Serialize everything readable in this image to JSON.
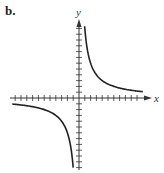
{
  "panel_label": "b.",
  "chart_data": {
    "type": "line",
    "title": "",
    "xlabel": "x",
    "ylabel": "y",
    "function": "y = k/x (rectangular hyperbola, k ≈ 12)",
    "xlim": [
      -11,
      11
    ],
    "ylim": [
      -12,
      13
    ],
    "grid": false,
    "tick_spacing": 1,
    "tick_labels": false,
    "series": [
      {
        "name": "branch-quadrant-I",
        "x": [
          1,
          1.5,
          2,
          3,
          4,
          6,
          8,
          10
        ],
        "y": [
          12,
          8,
          6,
          4,
          3,
          2,
          1.5,
          1.2
        ]
      },
      {
        "name": "branch-quadrant-III",
        "x": [
          -11,
          -10,
          -8,
          -6,
          -4,
          -3,
          -2,
          -1.5,
          -1
        ],
        "y": [
          -1.1,
          -1.2,
          -1.5,
          -2,
          -3,
          -4,
          -6,
          -8,
          -12
        ]
      }
    ],
    "colors": {
      "axes": "#333333",
      "curve": "#222222"
    }
  }
}
